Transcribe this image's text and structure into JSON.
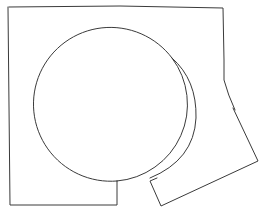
{
  "figure": {
    "stroke_color": "#3a3a3a",
    "background": "#ffffff"
  }
}
